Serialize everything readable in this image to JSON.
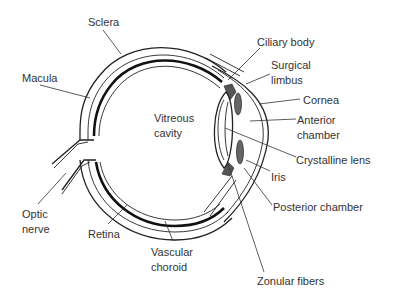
{
  "labels": {
    "sclera": "Sclera",
    "macula": "Macula",
    "vitreous_line1": "Vitreous",
    "vitreous_line2": "cavity",
    "ciliary_body": "Ciliary body",
    "surgical_line1": "Surgical",
    "surgical_line2": "limbus",
    "cornea": "Cornea",
    "anterior_line1": "Anterior",
    "anterior_line2": "chamber",
    "crystalline_lens": "Crystalline lens",
    "iris": "Iris",
    "posterior_chamber": "Posterior chamber",
    "optic_line1": "Optic",
    "optic_line2": "nerve",
    "retina": "Retina",
    "vascular_line1": "Vascular",
    "vascular_line2": "choroid",
    "zonular_fibers": "Zonular fibers"
  },
  "colors": {
    "line": "#222222",
    "text": "#333333",
    "background": "#ffffff"
  }
}
